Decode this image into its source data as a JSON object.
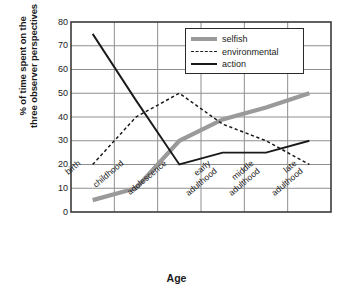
{
  "chart_data": {
    "type": "line",
    "title": "",
    "xlabel": "Age",
    "ylabel": "% of time spent on the three observer perspectives",
    "ylabel_line1": "% of time spent on the",
    "ylabel_line2": "three observer perspectives",
    "categories": [
      "birth",
      "childhood",
      "adolescence",
      "early adulthood",
      "middle adulthood",
      "late adulthood"
    ],
    "category_lines": [
      [
        "birth"
      ],
      [
        "childhood"
      ],
      [
        "adolescence"
      ],
      [
        "early",
        "adulthood"
      ],
      [
        "middle",
        "adulthood"
      ],
      [
        "late",
        "adulthood"
      ]
    ],
    "ylim": [
      0,
      80
    ],
    "yticks": [
      80,
      70,
      60,
      50,
      40,
      30,
      20,
      10,
      0
    ],
    "grid": true,
    "legend_position": "upper-right",
    "series": [
      {
        "name": "selfish",
        "values": [
          5,
          10,
          30,
          39,
          44,
          50
        ],
        "color": "#9a9a9a",
        "style": "thick-solid",
        "width": 4.2
      },
      {
        "name": "environmental",
        "values": [
          20,
          40,
          50,
          37,
          30,
          20
        ],
        "color": "#1a1a1a",
        "style": "dashed",
        "width": 1.5
      },
      {
        "name": "action",
        "values": [
          75,
          47,
          20,
          25,
          25,
          30
        ],
        "color": "#1a1a1a",
        "style": "solid",
        "width": 1.9
      }
    ],
    "colors": {
      "axis": "#3a3a3a",
      "grid": "#8f8f8f",
      "text": "#1a1a1a",
      "background": "#ffffff",
      "selfish": "#9a9a9a",
      "environmental": "#1a1a1a",
      "action": "#1a1a1a"
    }
  },
  "legend": {
    "items": [
      {
        "label": "selfish",
        "key": "selfish"
      },
      {
        "label": "environmental",
        "key": "environmental"
      },
      {
        "label": "action",
        "key": "action"
      }
    ]
  }
}
